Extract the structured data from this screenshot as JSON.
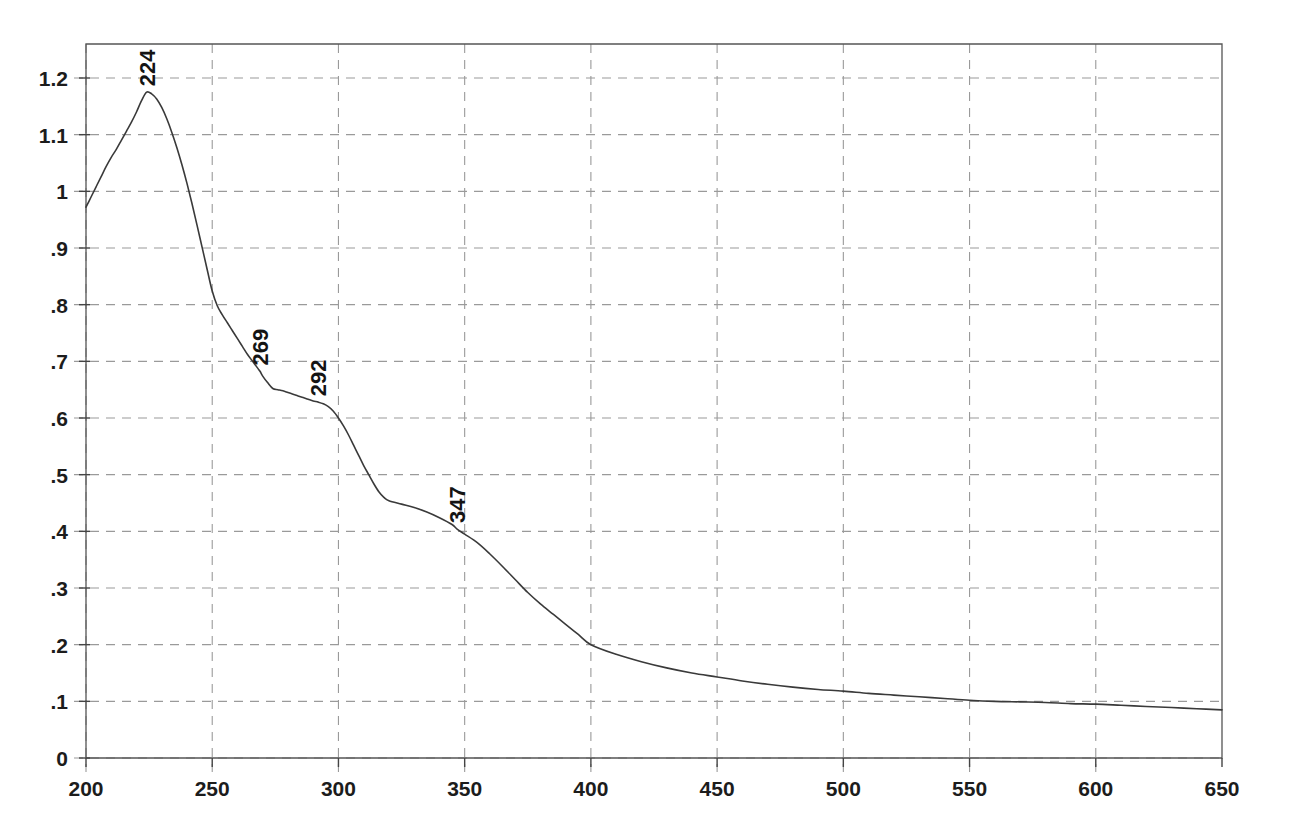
{
  "chart_data": {
    "type": "line",
    "title": "",
    "subtitle": "",
    "xlabel": "",
    "ylabel": "",
    "xlim": [
      200,
      650
    ],
    "ylim": [
      0,
      1.26
    ],
    "grid": true,
    "legend": "none",
    "x_ticks": [
      200,
      250,
      300,
      350,
      400,
      450,
      500,
      550,
      600,
      650
    ],
    "x_tick_labels": [
      "200",
      "250",
      "300",
      "350",
      "400",
      "450",
      "500",
      "550",
      "600",
      "650"
    ],
    "y_ticks": [
      0,
      0.1,
      0.2,
      0.3,
      0.4,
      0.5,
      0.6,
      0.7,
      0.8,
      0.9,
      1.0,
      1.1,
      1.2
    ],
    "y_tick_labels": [
      "0",
      ".1",
      ".2",
      ".3",
      ".4",
      ".5",
      ".6",
      ".7",
      ".8",
      ".9",
      "1",
      "1.1",
      "1.2"
    ],
    "series": [
      {
        "name": "absorbance",
        "color": "#3a3a3a",
        "x": [
          200,
          202,
          204,
          206,
          208,
          210,
          212,
          214,
          216,
          218,
          220,
          222,
          224,
          226,
          228,
          230,
          232,
          234,
          236,
          238,
          240,
          242,
          244,
          246,
          248,
          250,
          252,
          254,
          256,
          258,
          260,
          262,
          264,
          266,
          268,
          269,
          270,
          272,
          274,
          276,
          278,
          280,
          282,
          284,
          286,
          288,
          290,
          292,
          294,
          296,
          298,
          300,
          302,
          304,
          306,
          308,
          310,
          312,
          314,
          316,
          318,
          320,
          325,
          330,
          335,
          340,
          345,
          347,
          350,
          355,
          360,
          365,
          370,
          375,
          380,
          385,
          390,
          395,
          400,
          410,
          420,
          430,
          440,
          450,
          460,
          470,
          480,
          490,
          500,
          510,
          520,
          530,
          540,
          550,
          560,
          570,
          580,
          590,
          600,
          610,
          620,
          630,
          640,
          650
        ],
        "y": [
          0.972,
          0.99,
          1.008,
          1.026,
          1.044,
          1.06,
          1.074,
          1.09,
          1.106,
          1.122,
          1.14,
          1.16,
          1.175,
          1.172,
          1.163,
          1.148,
          1.128,
          1.104,
          1.077,
          1.047,
          1.014,
          0.978,
          0.94,
          0.901,
          0.862,
          0.824,
          0.798,
          0.782,
          0.768,
          0.754,
          0.74,
          0.726,
          0.712,
          0.7,
          0.688,
          0.682,
          0.674,
          0.662,
          0.652,
          0.65,
          0.648,
          0.645,
          0.642,
          0.639,
          0.636,
          0.633,
          0.63,
          0.628,
          0.625,
          0.62,
          0.612,
          0.6,
          0.586,
          0.57,
          0.552,
          0.534,
          0.516,
          0.5,
          0.484,
          0.47,
          0.46,
          0.454,
          0.448,
          0.442,
          0.434,
          0.424,
          0.412,
          0.404,
          0.395,
          0.38,
          0.36,
          0.338,
          0.315,
          0.292,
          0.272,
          0.254,
          0.236,
          0.218,
          0.2,
          0.183,
          0.17,
          0.159,
          0.15,
          0.143,
          0.136,
          0.13,
          0.125,
          0.121,
          0.118,
          0.114,
          0.111,
          0.108,
          0.105,
          0.102,
          0.1,
          0.099,
          0.098,
          0.096,
          0.095,
          0.093,
          0.091,
          0.089,
          0.087,
          0.085
        ]
      }
    ],
    "annotations": [
      {
        "label": "224",
        "x": 224,
        "y": 1.175,
        "rotation": -90
      },
      {
        "label": "269",
        "x": 269,
        "y": 0.682,
        "rotation": -90
      },
      {
        "label": "292",
        "x": 292,
        "y": 0.628,
        "rotation": -90
      },
      {
        "label": "347",
        "x": 347,
        "y": 0.404,
        "rotation": -90
      }
    ]
  },
  "style": {
    "curve_color": "#3a3a3a",
    "grid_color": "#9a9a9a",
    "frame_color": "#555555",
    "text_color": "#1c1c1c",
    "background": "#ffffff"
  }
}
